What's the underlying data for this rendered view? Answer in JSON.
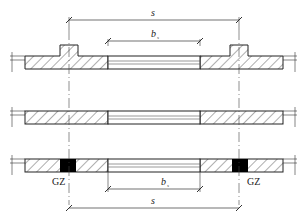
{
  "diagram": {
    "type": "structural wall plan sections",
    "labels": {
      "spacing": "s",
      "opening_width_main": "b",
      "opening_width_sub": "s",
      "column_left": "GZ",
      "column_right": "GZ"
    },
    "sections": [
      {
        "id": "top",
        "description": "wall with pilasters at both ends of opening"
      },
      {
        "id": "middle",
        "description": "plain wall with opening"
      },
      {
        "id": "bottom",
        "description": "wall with constructional columns (GZ) at opening"
      }
    ],
    "colors": {
      "line": "#222222",
      "hatch": "#333333",
      "fill_column": "#000000",
      "background": "#ffffff"
    }
  }
}
